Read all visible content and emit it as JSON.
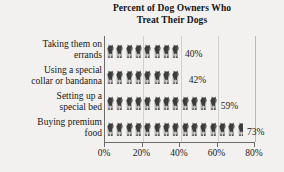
{
  "chart_data": {
    "type": "bar",
    "orientation": "horizontal",
    "title": "Percent of Dog Owners Who Treat Their Dogs",
    "title_lines": [
      "Percent of Dog Owners Who",
      "Treat Their Dogs"
    ],
    "categories": [
      "Taking them on errands",
      "Using a special collar or bandanna",
      "Setting up a special bed",
      "Buying premium food"
    ],
    "category_lines": [
      [
        "Taking them on",
        "errands"
      ],
      [
        "Using a special",
        "collar or bandanna"
      ],
      [
        "Setting up a",
        "special bed"
      ],
      [
        "Buying premium",
        "food"
      ]
    ],
    "values": [
      40,
      42,
      59,
      73
    ],
    "value_labels": [
      "40%",
      "42%",
      "59%",
      "73%"
    ],
    "xlabel": "",
    "ylabel": "",
    "xlim": [
      0,
      80
    ],
    "xticks": [
      0,
      20,
      40,
      60,
      80
    ],
    "xtick_labels": [
      "0%",
      "20%",
      "40%",
      "60%",
      "80%"
    ],
    "grid": true,
    "grid_axis": "x",
    "legend": null,
    "bar_fill": "pictograph-dog-icons",
    "icon_name": "dog-icon",
    "colors": {
      "background": "#f2f1ef",
      "axis": "#6b6b6b",
      "gridline": "#cfcfcd",
      "text": "#1a1a1a",
      "icon_dark": "#3c3c3c",
      "icon_light": "#c9c9c7"
    }
  }
}
